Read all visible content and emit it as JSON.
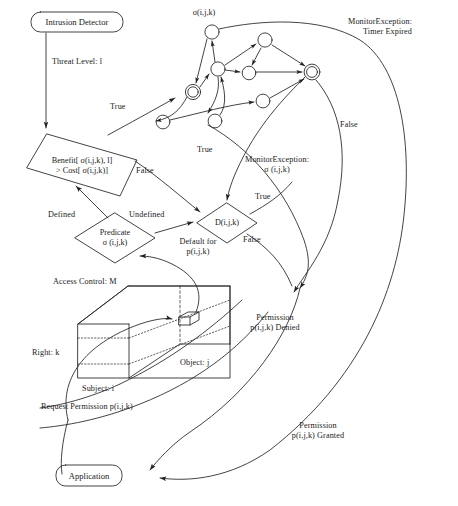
{
  "diagram": {
    "stroke_color": "#222222",
    "text_color": "#1a1a1a",
    "background": "#ffffff",
    "nodes": {
      "intrusion_detector": {
        "label": "Intrusion Detector",
        "shape": "rounded-box"
      },
      "application": {
        "label": "Application",
        "shape": "rounded-box"
      },
      "benefit_cost": {
        "label_line1": "Benefit[  σ(i,j,k), l]",
        "label_line2": "> Cost[  σ(i,j,k)]",
        "shape": "diamond"
      },
      "predicate": {
        "label_line1": "Predicate",
        "label_line2": "σ (i,j,k)",
        "shape": "diamond"
      },
      "default_decision": {
        "label": "D(i,j,k)",
        "shape": "diamond"
      },
      "access_control_matrix": {
        "label": "Access Control: M",
        "shape": "cube"
      }
    },
    "edge_labels": {
      "threat_level": "Threat Level: l",
      "true_to_state_machine": "True",
      "false_from_benefit": "False",
      "defined": "Defined",
      "undefined": "Undefined",
      "true_from_state_machine": "True",
      "true_from_decision": "True",
      "false_from_decision": "False",
      "false_from_monitor": "False",
      "monitor_exception_timer": "MonitorException:\nTimer Expired",
      "monitor_exception_timer_line1": "MonitorException:",
      "monitor_exception_timer_line2": "Timer Expired",
      "monitor_exception_sigma_line1": "MonitorException:",
      "monitor_exception_sigma_line2": "σ (i,j,k)",
      "default_for_line1": "Default for",
      "default_for_line2": "p(i,j,k)",
      "permission_denied_line1": "Permission",
      "permission_denied_line2": "p(i,j,k) Denied",
      "permission_granted_line1": "Permission",
      "permission_granted_line2": "p(i,j,k) Granted",
      "request_permission": "Request Permission p(i,j,k)"
    },
    "cube_labels": {
      "matrix_name": "Access Control: M",
      "right_axis": "Right: k",
      "subject_axis": "Subject: i",
      "object_axis": "Object: j"
    },
    "state_machine": {
      "sigma_label": "σ(i,j,k)",
      "start_state_name": "start-state",
      "accept_state_name": "accept-state",
      "state_count": 7,
      "double_circle_states": 2
    }
  }
}
